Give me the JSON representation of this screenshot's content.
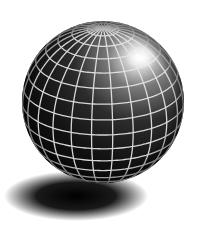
{
  "image": {
    "subject": "wireframe-globe",
    "background_color": "#ffffff",
    "sphere": {
      "cx": 103,
      "cy": 102,
      "r": 81,
      "base_color": "#0a0a0a",
      "grid_color": "#e8e8e8",
      "highlight": {
        "cx": 142,
        "cy": 58,
        "color": "#ffffff"
      },
      "pole": {
        "cx": 101,
        "cy": 31
      },
      "latitude_lines": 16,
      "longitude_lines": 24
    },
    "shadow": {
      "cx": 76,
      "cy": 196,
      "rx": 70,
      "ry": 23,
      "color": "#000000"
    }
  }
}
